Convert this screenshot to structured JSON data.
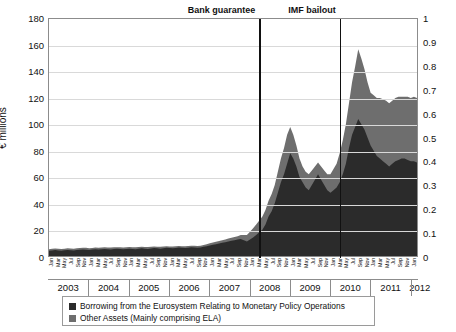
{
  "chart_data": {
    "type": "area",
    "title": "",
    "ylabel": "€ millions",
    "xlabel": "",
    "ylim": [
      0,
      180
    ],
    "ytick_step": 20,
    "yticks_left": [
      "0",
      "20",
      "40",
      "60",
      "80",
      "100",
      "120",
      "140",
      "160",
      "180"
    ],
    "ylim_right": [
      0,
      1
    ],
    "yticks_right": [
      "0",
      "0.1",
      "0.2",
      "0.3",
      "0.4",
      "0.5",
      "0.6",
      "0.7",
      "0.8",
      "0.9",
      "1"
    ],
    "grid": true,
    "legend_position": "bottom",
    "stacked": true,
    "years": [
      "2003",
      "2004",
      "2005",
      "2006",
      "2007",
      "2008",
      "2009",
      "2010",
      "2011",
      "2012"
    ],
    "months": [
      "Jan",
      "Mar",
      "May",
      "Jul",
      "Sep",
      "Nov"
    ],
    "annotations": [
      {
        "label": "Bank guarantee",
        "x_index": 68,
        "align": "right"
      },
      {
        "label": "IMF bailout",
        "x_index": 94,
        "align": "right"
      }
    ],
    "series": [
      {
        "name": "Borrowing from the Eurosystem Relating to Monetary Policy Operations",
        "color": "#2b2b2b",
        "values": [
          4,
          4.2,
          4.5,
          4.2,
          4,
          4.3,
          4.6,
          4.4,
          4.2,
          4.5,
          4.8,
          5,
          4.8,
          4.6,
          4.9,
          5.1,
          4.9,
          5.2,
          5.4,
          5.2,
          5,
          5.3,
          5.5,
          5.3,
          5.1,
          5.4,
          5.6,
          5.4,
          5.2,
          5.5,
          5.8,
          5.6,
          5.4,
          5.7,
          6,
          5.8,
          5.6,
          5.9,
          6.2,
          6,
          5.8,
          6.1,
          6.4,
          6.2,
          6,
          6.3,
          6.6,
          6.4,
          6.2,
          6.5,
          7,
          7.5,
          8,
          8.5,
          9,
          9.5,
          10,
          10.5,
          11,
          11.5,
          12,
          12.5,
          13,
          12,
          11,
          12.5,
          14,
          16,
          18,
          20,
          24,
          30,
          34,
          40,
          48,
          56,
          62,
          70,
          78,
          74,
          68,
          60,
          56,
          52,
          50,
          54,
          58,
          62,
          58,
          54,
          50,
          48,
          50,
          52,
          56,
          62,
          70,
          82,
          92,
          98,
          104,
          100,
          96,
          90,
          84,
          80,
          76,
          74,
          72,
          70,
          68,
          70,
          72,
          73,
          74,
          74,
          73,
          72,
          72,
          71
        ]
      },
      {
        "name": "Other Assets (Mainly comprising ELA)",
        "color": "#6e6e6e",
        "values": [
          1.2,
          1.3,
          1.2,
          1.3,
          1.4,
          1.3,
          1.2,
          1.3,
          1.4,
          1.3,
          1.2,
          1.3,
          1.4,
          1.3,
          1.2,
          1.3,
          1.4,
          1.3,
          1.2,
          1.3,
          1.4,
          1.3,
          1.2,
          1.3,
          1.4,
          1.3,
          1.2,
          1.3,
          1.4,
          1.3,
          1.2,
          1.3,
          1.4,
          1.3,
          1.2,
          1.3,
          1.4,
          1.3,
          1.2,
          1.3,
          1.4,
          1.3,
          1.2,
          1.3,
          1.4,
          1.3,
          1.2,
          1.3,
          1.4,
          1.3,
          1.4,
          1.5,
          1.6,
          1.7,
          1.8,
          1.9,
          2,
          2.1,
          2.2,
          2.3,
          2.4,
          2.5,
          3,
          4,
          5,
          6,
          7,
          8,
          9,
          10,
          11,
          12,
          13,
          14,
          16,
          18,
          20,
          22,
          20,
          18,
          16,
          14,
          12,
          12,
          12,
          11,
          10,
          9,
          10,
          11,
          12,
          14,
          16,
          18,
          22,
          26,
          30,
          34,
          40,
          46,
          53,
          50,
          46,
          42,
          40,
          42,
          44,
          46,
          47,
          48,
          48,
          48,
          48,
          48,
          47,
          47,
          48,
          48,
          49,
          49
        ]
      }
    ]
  },
  "legend": {
    "entries": [
      {
        "label": "Borrowing from the Eurosystem Relating to Monetary Policy Operations",
        "color": "#2b2b2b"
      },
      {
        "label": "Other Assets (Mainly comprising ELA)",
        "color": "#6e6e6e"
      }
    ]
  }
}
